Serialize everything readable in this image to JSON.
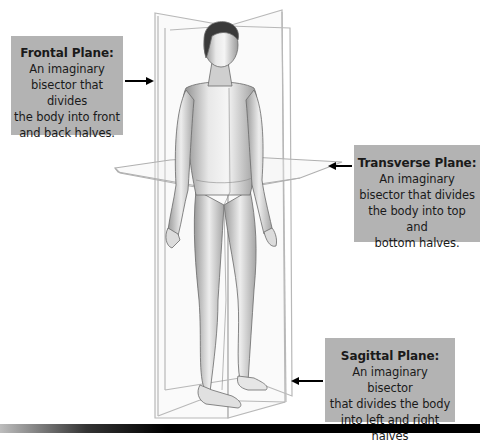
{
  "diagram": {
    "colors": {
      "label_background": "#b3b3b3",
      "label_text": "#1a1a1a",
      "arrow": "#000000",
      "plane_outline": "#b8b8b8",
      "bottom_bar": "#000000"
    },
    "labels": [
      {
        "id": "frontal",
        "title": "Frontal Plane:",
        "description_lines": [
          "An imaginary",
          "bisector that divides",
          "the body into front",
          "and back halves."
        ],
        "arrow_direction": "right"
      },
      {
        "id": "transverse",
        "title": "Transverse Plane:",
        "description_lines": [
          "An imaginary",
          "bisector that divides",
          "the body into top and",
          "bottom halves."
        ],
        "arrow_direction": "left"
      },
      {
        "id": "sagittal",
        "title": "Sagittal Plane:",
        "description_lines": [
          "An imaginary bisector",
          "that divides the body",
          "into left and right halves"
        ],
        "arrow_direction": "left"
      }
    ],
    "figure": "male-human-figure-anatomical-position"
  }
}
